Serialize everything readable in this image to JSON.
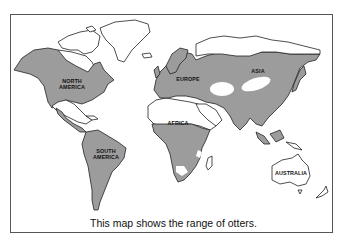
{
  "map": {
    "caption": "This map shows the range of otters.",
    "fill_color": "#9c9c9c",
    "outline_color": "#222222",
    "labels": {
      "north_america": "NORTH AMERICA",
      "north_america_l1": "NORTH",
      "north_america_l2": "AMERICA",
      "south_america_l1": "SOUTH",
      "south_america_l2": "AMERICA",
      "europe": "EUROPE",
      "asia": "ASIA",
      "africa": "AFRICA",
      "australia": "AUSTRALIA"
    },
    "shaded_regions": [
      "North America (except far north and parts of Mexico/SW US)",
      "South America",
      "Europe",
      "Asia (except northern Siberia, central deserts, Arabia)",
      "Sub-Saharan Africa (except southwest)",
      "Southeast Asian islands"
    ],
    "unshaded_regions": [
      "Arctic islands",
      "Greenland",
      "Northern Siberia",
      "Sahara / North Africa",
      "Arabian Peninsula",
      "Central Asian deserts",
      "Australia",
      "New Zealand",
      "Madagascar"
    ]
  }
}
